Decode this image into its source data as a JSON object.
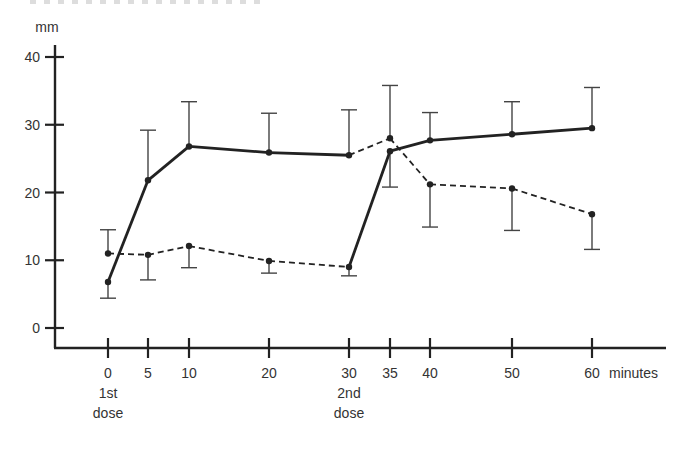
{
  "figure": {
    "y_unit": "mm",
    "x_unit": "minutes",
    "dose_markers": [
      {
        "x": 0,
        "line1": "1st",
        "line2": "dose"
      },
      {
        "x": 30,
        "line1": "2nd",
        "line2": "dose"
      }
    ]
  },
  "chart_data": {
    "type": "line",
    "title": "",
    "xlabel": "minutes",
    "ylabel": "mm",
    "x": [
      0,
      5,
      10,
      20,
      30,
      35,
      40,
      50,
      60
    ],
    "x_ticks": [
      "0",
      "5",
      "10",
      "20",
      "30",
      "35",
      "40",
      "50",
      "60"
    ],
    "y_ticks": [
      "0",
      "10",
      "20",
      "30",
      "40"
    ],
    "ylim": [
      0,
      40
    ],
    "grid": false,
    "legend": null,
    "annotations": [
      "1st dose (at 0 min)",
      "2nd dose (at 30 min)"
    ],
    "line_style_note": "Series A drawn solid 0–30 min and dashed 30–60 min; Series B drawn dashed 0–30 min and solid 30–60 min",
    "series": [
      {
        "name": "Series A",
        "values": [
          6.8,
          21.8,
          26.8,
          25.9,
          25.5,
          28.0,
          21.2,
          20.6,
          16.8
        ],
        "error_bar": [
          {
            "dir": "down",
            "end": 4.4
          },
          {
            "dir": "up",
            "end": 29.2
          },
          {
            "dir": "up",
            "end": 33.4
          },
          {
            "dir": "up",
            "end": 31.7
          },
          {
            "dir": "up",
            "end": 32.2
          },
          {
            "dir": "up",
            "end": 35.8
          },
          {
            "dir": "down",
            "end": 14.9
          },
          {
            "dir": "down",
            "end": 14.4
          },
          {
            "dir": "down",
            "end": 11.6
          }
        ],
        "style": [
          "solid",
          "solid",
          "solid",
          "solid",
          "dashed",
          "dashed",
          "dashed",
          "dashed"
        ]
      },
      {
        "name": "Series B",
        "values": [
          11.0,
          10.8,
          12.1,
          9.9,
          9.0,
          26.1,
          27.7,
          28.6,
          29.5
        ],
        "error_bar": [
          {
            "dir": "up",
            "end": 14.5
          },
          {
            "dir": "down",
            "end": 7.1
          },
          {
            "dir": "down",
            "end": 8.9
          },
          {
            "dir": "down",
            "end": 8.1
          },
          {
            "dir": "down",
            "end": 7.7
          },
          {
            "dir": "down",
            "end": 20.8
          },
          {
            "dir": "up",
            "end": 31.8
          },
          {
            "dir": "up",
            "end": 33.4
          },
          {
            "dir": "up",
            "end": 35.5
          }
        ],
        "style": [
          "dashed",
          "dashed",
          "dashed",
          "dashed",
          "solid",
          "solid",
          "solid",
          "solid"
        ]
      }
    ]
  }
}
